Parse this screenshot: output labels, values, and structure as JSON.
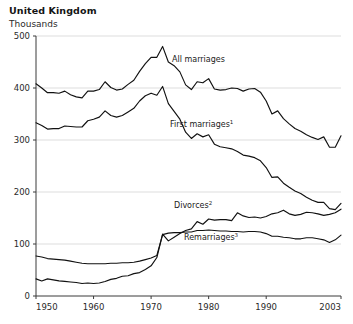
{
  "header": {
    "title": "United Kingdom",
    "subtitle": "Thousands"
  },
  "axis": {
    "y_ticks": [
      "0",
      "100",
      "200",
      "300",
      "400",
      "500"
    ],
    "x_ticks": [
      "1950",
      "1960",
      "1970",
      "1980",
      "1990",
      "2003"
    ]
  },
  "labels": {
    "all_marriages": "All marriages",
    "first_marriages": "First marriages",
    "first_marriages_sup": "1",
    "divorces": "Divorces",
    "divorces_sup": "2",
    "remarriages": "Remarriages",
    "remarriages_sup": "3"
  },
  "chart_data": {
    "type": "line",
    "title": "United Kingdom",
    "subtitle": "Thousands",
    "xlabel": "",
    "ylabel": "Thousands",
    "ylim": [
      0,
      500
    ],
    "xlim": [
      1950,
      2003
    ],
    "grid": true,
    "legend_position": "inline-annotations",
    "y_ticks": [
      0,
      100,
      200,
      300,
      400,
      500
    ],
    "x_ticks": [
      1950,
      1960,
      1970,
      1980,
      1990,
      2003
    ],
    "x": [
      1950,
      1951,
      1952,
      1953,
      1954,
      1955,
      1956,
      1957,
      1958,
      1959,
      1960,
      1961,
      1962,
      1963,
      1964,
      1965,
      1966,
      1967,
      1968,
      1969,
      1970,
      1971,
      1972,
      1973,
      1974,
      1975,
      1976,
      1977,
      1978,
      1979,
      1980,
      1981,
      1982,
      1983,
      1984,
      1985,
      1986,
      1987,
      1988,
      1989,
      1990,
      1991,
      1992,
      1993,
      1994,
      1995,
      1996,
      1997,
      1998,
      1999,
      2000,
      2001,
      2002,
      2003
    ],
    "series": [
      {
        "name": "All marriages",
        "values": [
          408,
          400,
          391,
          391,
          390,
          394,
          387,
          383,
          381,
          394,
          394,
          397,
          412,
          401,
          396,
          398,
          407,
          415,
          432,
          447,
          459,
          459,
          480,
          450,
          443,
          431,
          406,
          397,
          412,
          410,
          418,
          398,
          396,
          397,
          400,
          399,
          394,
          398,
          399,
          392,
          375,
          350,
          356,
          341,
          331,
          322,
          317,
          310,
          305,
          301,
          306,
          286,
          286,
          308
        ]
      },
      {
        "name": "First marriages",
        "values": [
          333,
          328,
          321,
          322,
          322,
          327,
          326,
          325,
          325,
          337,
          340,
          344,
          356,
          347,
          344,
          347,
          354,
          361,
          375,
          385,
          390,
          386,
          403,
          370,
          355,
          340,
          315,
          303,
          312,
          306,
          310,
          292,
          287,
          285,
          283,
          278,
          271,
          269,
          266,
          260,
          247,
          228,
          229,
          217,
          209,
          202,
          197,
          190,
          184,
          180,
          180,
          168,
          166,
          178
        ]
      },
      {
        "name": "Divorces",
        "values": [
          33,
          29,
          33,
          31,
          29,
          28,
          27,
          26,
          24,
          25,
          24,
          25,
          28,
          32,
          34,
          38,
          39,
          43,
          45,
          51,
          58,
          74,
          119,
          106,
          113,
          120,
          126,
          129,
          143,
          138,
          148,
          146,
          147,
          147,
          145,
          160,
          154,
          151,
          152,
          150,
          153,
          158,
          160,
          165,
          158,
          155,
          157,
          161,
          160,
          158,
          155,
          157,
          160,
          167
        ]
      },
      {
        "name": "Remarriages",
        "values": [
          77,
          75,
          72,
          71,
          70,
          69,
          67,
          65,
          63,
          62,
          62,
          62,
          62,
          63,
          63,
          64,
          64,
          65,
          67,
          70,
          73,
          78,
          118,
          121,
          122,
          122,
          123,
          123,
          126,
          126,
          127,
          126,
          125,
          125,
          124,
          124,
          123,
          124,
          124,
          123,
          120,
          115,
          115,
          113,
          112,
          110,
          110,
          112,
          112,
          110,
          108,
          103,
          108,
          117
        ]
      }
    ]
  }
}
